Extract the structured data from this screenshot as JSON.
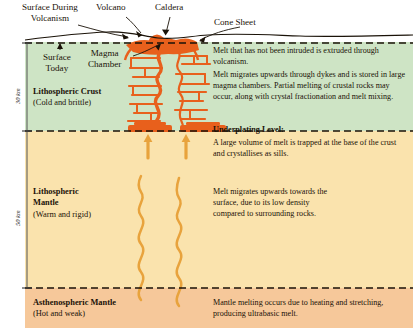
{
  "diagram": {
    "colors": {
      "crust": "#cee4c5",
      "lithospheric_mantle": "#fae3ad",
      "asthenospheric_mantle": "#f6c89a",
      "magma": "#e8601c",
      "melt_arrow": "#e8a33d",
      "text": "#1a1208"
    }
  },
  "callouts": {
    "surface_during_volcanism": "Surface During\nVolcanism",
    "volcano": "Volcano",
    "caldera": "Caldera",
    "cone_sheet": "Cone Sheet",
    "surface_today": "Surface\nToday",
    "magma_chamber": "Magma\nChamber"
  },
  "layers": [
    {
      "id": "crust",
      "name": "Lithospheric Crust",
      "qualifier": "(Cold and brittle)",
      "depth_label": "30 km"
    },
    {
      "id": "lithospheric-mantle",
      "name": "Lithospheric",
      "name2": "Mantle",
      "qualifier": "(Warm and rigid)",
      "depth_label": "50 km"
    },
    {
      "id": "asthenospheric-mantle",
      "name": "Asthenospheric Mantle",
      "qualifier": "(Hot and weak)",
      "depth_label": ""
    }
  ],
  "notes": {
    "extrusion": "Melt that has not been intruded is extruded through volcanism.",
    "dykes": "Melt migrates upwards through dykes and is stored in large magma chambers. Partial melting of crustal rocks may occur, along with crystal fractionation and melt mixing.",
    "underplating_heading": "Underplating Level:",
    "underplating": "A large volume of melt is trapped at the base of the crust and crystallises as sills.",
    "migration": "Melt migrates upwards towards the surface, due to its low density compared to surrounding rocks.",
    "asthenosphere": "Mantle melting occurs due to heating and stretching, producing ultrabasic melt."
  }
}
